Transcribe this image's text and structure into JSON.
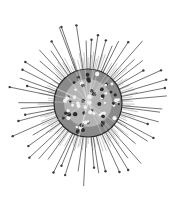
{
  "image": {
    "subject": "radiolarian illustration",
    "description": "Engraving-style drawing of a spherical radiolarian with a perforated lattice shell and many long radiating spines tipped with small knobs",
    "background": "#ffffff",
    "ink_color": "#3a3a3a"
  },
  "organism": {
    "center": [
      88,
      103
    ],
    "shell_radius": 34,
    "inner_glow_radius": 24,
    "pore_count": 70,
    "spines": {
      "long_count": 56,
      "short_count": 110,
      "long_min_length": 62,
      "long_max_length": 84,
      "short_min_length": 40,
      "short_max_length": 52,
      "knob_radius": 1.2
    }
  }
}
